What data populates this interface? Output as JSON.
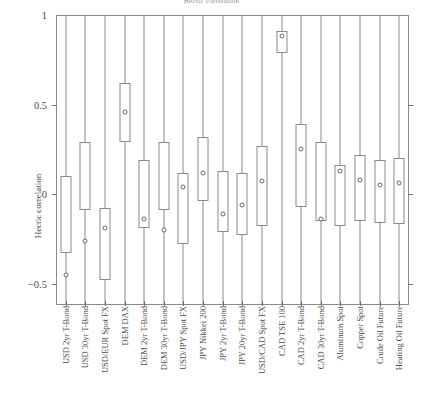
{
  "chart_data": {
    "type": "box",
    "title": "Hectic correlation",
    "xlabel": "",
    "ylabel": "Hectic correlation",
    "ylim": [
      -0.62,
      1.0
    ],
    "yticks": [
      1,
      0.5,
      0,
      -0.5
    ],
    "ytick_labels": [
      "1",
      "0.5",
      "0",
      "−0.5"
    ],
    "grid": false,
    "legend": "none",
    "categories": [
      "USD 2yr T-Bond",
      "USD 30yr T-Bond",
      "USD/EUR Spot FX",
      "DEM DAX",
      "DEM 2yr T-Bond",
      "DEM 30yr T-Bond",
      "USD/JPY Spot FX",
      "JPY Nikkei 200",
      "JPY 2yr T-Bond",
      "JPY 20yr T-Bond",
      "USD/CAD Spot FX",
      "CAD TSE 100",
      "CAD 2yr T-Bond",
      "CAD 30yr T-Bond",
      "Aluminum Spot",
      "Copper Spot",
      "Crude Oil Future",
      "Heating Oil Future"
    ],
    "boxes": [
      {
        "category": "USD 2yr T-Bond",
        "whisker_low": -0.62,
        "q1": -0.33,
        "q3": 0.1,
        "whisker_high": 1.0,
        "mean": -0.45
      },
      {
        "category": "USD 30yr T-Bond",
        "whisker_low": -0.62,
        "q1": -0.09,
        "q3": 0.29,
        "whisker_high": 1.0,
        "mean": -0.26
      },
      {
        "category": "USD/EUR Spot FX",
        "whisker_low": -0.62,
        "q1": -0.48,
        "q3": -0.08,
        "whisker_high": 1.0,
        "mean": -0.19
      },
      {
        "category": "DEM DAX",
        "whisker_low": -0.62,
        "q1": 0.29,
        "q3": 0.62,
        "whisker_high": 1.0,
        "mean": 0.46
      },
      {
        "category": "DEM 2yr T-Bond",
        "whisker_low": -0.62,
        "q1": -0.19,
        "q3": 0.19,
        "whisker_high": 1.0,
        "mean": -0.14
      },
      {
        "category": "DEM 30yr T-Bond",
        "whisker_low": -0.62,
        "q1": -0.09,
        "q3": 0.29,
        "whisker_high": 1.0,
        "mean": -0.2
      },
      {
        "category": "USD/JPY Spot FX",
        "whisker_low": -0.62,
        "q1": -0.28,
        "q3": 0.12,
        "whisker_high": 1.0,
        "mean": 0.04
      },
      {
        "category": "JPY Nikkei 200",
        "whisker_low": -0.62,
        "q1": -0.04,
        "q3": 0.32,
        "whisker_high": 1.0,
        "mean": 0.12
      },
      {
        "category": "JPY 2yr T-Bond",
        "whisker_low": -0.62,
        "q1": -0.21,
        "q3": 0.13,
        "whisker_high": 1.0,
        "mean": -0.11
      },
      {
        "category": "JPY 20yr T-Bond",
        "whisker_low": -0.62,
        "q1": -0.23,
        "q3": 0.12,
        "whisker_high": 1.0,
        "mean": -0.06
      },
      {
        "category": "USD/CAD Spot FX",
        "whisker_low": -0.62,
        "q1": -0.18,
        "q3": 0.27,
        "whisker_high": 1.0,
        "mean": 0.07
      },
      {
        "category": "CAD TSE 100",
        "whisker_low": -0.62,
        "q1": 0.79,
        "q3": 0.91,
        "whisker_high": 1.0,
        "mean": 0.88
      },
      {
        "category": "CAD 2yr T-Bond",
        "whisker_low": -0.62,
        "q1": -0.07,
        "q3": 0.39,
        "whisker_high": 1.0,
        "mean": 0.25
      },
      {
        "category": "CAD 30yr T-Bond",
        "whisker_low": -0.62,
        "q1": -0.15,
        "q3": 0.29,
        "whisker_high": 1.0,
        "mean": -0.14
      },
      {
        "category": "Aluminum Spot",
        "whisker_low": -0.62,
        "q1": -0.18,
        "q3": 0.16,
        "whisker_high": 1.0,
        "mean": 0.13
      },
      {
        "category": "Copper Spot",
        "whisker_low": -0.62,
        "q1": -0.15,
        "q3": 0.22,
        "whisker_high": 1.0,
        "mean": 0.08
      },
      {
        "category": "Crude Oil Future",
        "whisker_low": -0.62,
        "q1": -0.16,
        "q3": 0.19,
        "whisker_high": 1.0,
        "mean": 0.05
      },
      {
        "category": "Heating Oil Future",
        "whisker_low": -0.62,
        "q1": -0.17,
        "q3": 0.2,
        "whisker_high": 1.0,
        "mean": 0.06
      }
    ]
  },
  "axis": {
    "y_title": "Hectic correlation"
  }
}
